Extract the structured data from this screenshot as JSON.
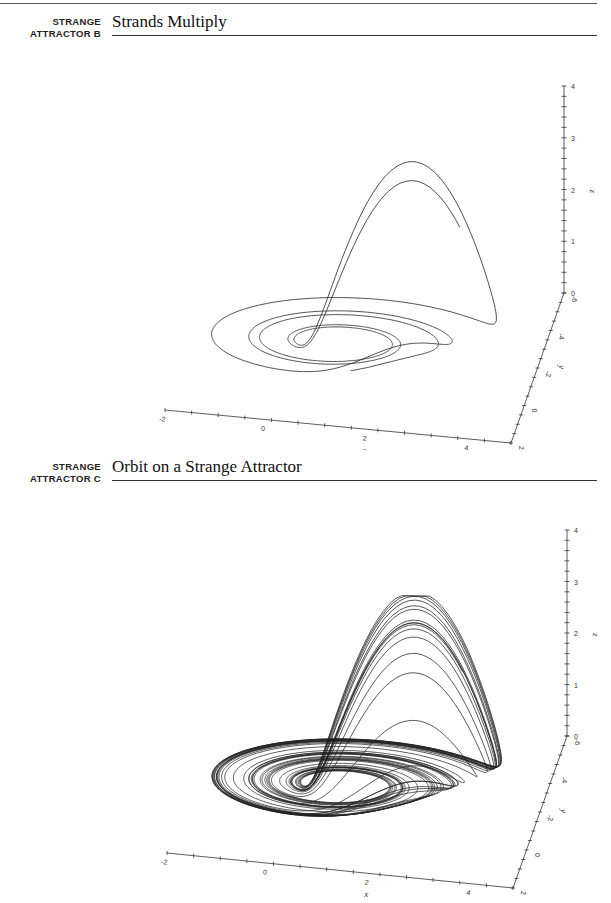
{
  "sections": [
    {
      "label_line1": "STRANGE",
      "label_line2": "ATTRACTOR B",
      "title": "Strands Multiply"
    },
    {
      "label_line1": "STRANGE",
      "label_line2": "ATTRACTOR C",
      "title": "Orbit on a Strange Attractor"
    }
  ],
  "chart_data": [
    {
      "type": "line",
      "subtype": "3d-trajectory",
      "title": "Strands Multiply",
      "description": "Short orbit on a Rössler-type strange attractor; a few strands spiralling outward and lifting into a lobe",
      "xlabel": "x",
      "ylabel": "y",
      "zlabel": "z",
      "x_ticks": [
        "-2",
        "0",
        "2",
        "4"
      ],
      "y_ticks": [
        "2",
        "0",
        "-2",
        "-4",
        "-6"
      ],
      "z_ticks": [
        "0",
        "1",
        "2",
        "3",
        "4"
      ],
      "xlim": [
        -2,
        4.8
      ],
      "ylim": [
        2,
        -6
      ],
      "zlim": [
        0,
        4
      ],
      "loops": 5,
      "line_width": 0.8,
      "axes_px": {
        "x_start": [
          165,
          410
        ],
        "x_end": [
          511,
          443
        ],
        "y_end": [
          564,
          293
        ],
        "z_top": [
          564,
          86
        ]
      }
    },
    {
      "type": "line",
      "subtype": "3d-trajectory",
      "title": "Orbit on a Strange Attractor",
      "description": "Long orbit on the same strange attractor; many densely packed strands forming a folded band",
      "xlabel": "x",
      "ylabel": "y",
      "zlabel": "z",
      "x_ticks": [
        "-2",
        "0",
        "2",
        "4"
      ],
      "y_ticks": [
        "2",
        "0",
        "-2",
        "-4",
        "-6"
      ],
      "z_ticks": [
        "0",
        "1",
        "2",
        "3",
        "4"
      ],
      "xlim": [
        -2,
        4.8
      ],
      "ylim": [
        2,
        -6
      ],
      "zlim": [
        0,
        4
      ],
      "loops": 40,
      "line_width": 0.75,
      "axes_px": {
        "x_start": [
          167,
          853
        ],
        "x_end": [
          513,
          888
        ],
        "y_end": [
          567,
          736
        ],
        "z_top": [
          567,
          530
        ]
      }
    }
  ]
}
